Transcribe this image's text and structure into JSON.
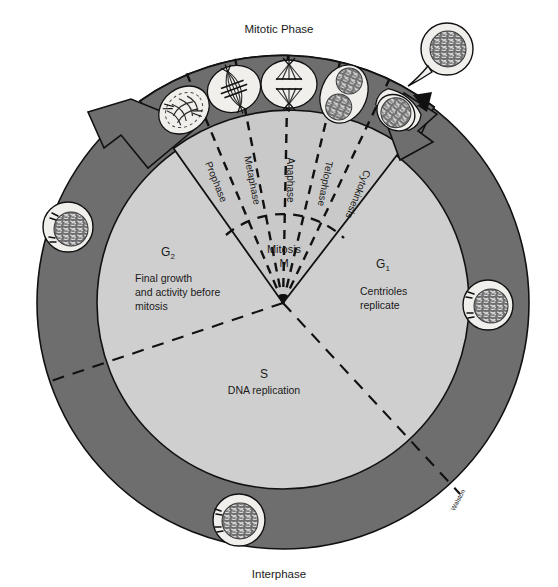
{
  "figure": {
    "title_top": "Mitotic Phase",
    "title_bottom": "Interphase",
    "signature": "Walston"
  },
  "colors": {
    "outer_ring": "#6e6e6e",
    "inner_disc": "#cfcfcf",
    "wedge_fill": "#c9c9c9",
    "arrow_fill": "#6e6e6e",
    "cell_cytoplasm": "#f0efec",
    "nucleus": "#6f6f6f",
    "outline": "#111111",
    "dashed": "#111111",
    "page_background": "#ffffff"
  },
  "mitotic_wedge": {
    "center_label": "Mitosis",
    "center_abbrev": "M",
    "phases": [
      {
        "label": "Prophase"
      },
      {
        "label": "Metaphase"
      },
      {
        "label": "Anaphase"
      },
      {
        "label": "Telophase"
      },
      {
        "label": "Cytokinesis"
      }
    ]
  },
  "interphase": {
    "stages": [
      {
        "abbrev": "G",
        "subscript": "2",
        "lines": [
          "Final growth",
          "and activity before",
          "mitosis"
        ]
      },
      {
        "abbrev": "G",
        "subscript": "1",
        "lines": [
          "Centrioles",
          "replicate"
        ]
      },
      {
        "abbrev": "S",
        "subscript": "",
        "lines": [
          "DNA replication"
        ]
      }
    ]
  },
  "cells": [
    {
      "name": "interphase-cell-left",
      "stage": "G2"
    },
    {
      "name": "interphase-cell-right",
      "stage": "G1"
    },
    {
      "name": "interphase-cell-bottom",
      "stage": "S"
    },
    {
      "name": "daughter-cell-exit",
      "stage": "post-cytokinesis"
    },
    {
      "name": "prophase-cell",
      "stage": "Prophase"
    },
    {
      "name": "metaphase-cell",
      "stage": "Metaphase"
    },
    {
      "name": "anaphase-cell",
      "stage": "Anaphase"
    },
    {
      "name": "telophase-cell",
      "stage": "Telophase"
    },
    {
      "name": "cytokinesis-cell",
      "stage": "Cytokinesis"
    }
  ]
}
